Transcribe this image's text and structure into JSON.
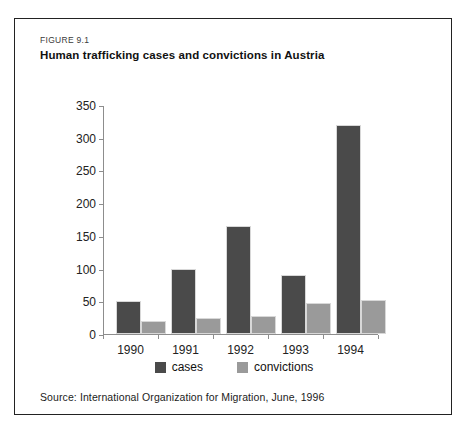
{
  "figure": {
    "number": "FIGURE 9.1",
    "title": "Human trafficking cases and convictions in Austria",
    "source": "Source: International Organization for Migration, June, 1996"
  },
  "colors": {
    "cases": "#4a4a4a",
    "convictions": "#9a9a9a",
    "axis": "#8d8d8d",
    "frame": "#222222",
    "background": "#ffffff"
  },
  "chart_data": {
    "type": "bar",
    "title": "Human trafficking cases and convictions in Austria",
    "xlabel": "",
    "ylabel": "",
    "categories": [
      "1990",
      "1991",
      "1992",
      "1993",
      "1994"
    ],
    "series": [
      {
        "name": "cases",
        "color": "#4a4a4a",
        "values": [
          50,
          100,
          165,
          90,
          320
        ]
      },
      {
        "name": "convictions",
        "color": "#9a9a9a",
        "values": [
          20,
          25,
          27,
          48,
          52
        ]
      }
    ],
    "ylim": [
      0,
      350
    ],
    "yticks": [
      0,
      50,
      100,
      150,
      200,
      250,
      300,
      350
    ],
    "ytick_labels": [
      "0",
      "50",
      "100",
      "150",
      "200",
      "250",
      "300",
      "350"
    ],
    "grid": false,
    "legend_position": "bottom-center",
    "legend_entries": [
      "cases",
      "convictions"
    ]
  }
}
